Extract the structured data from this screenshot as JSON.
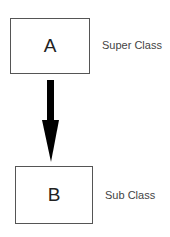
{
  "diagram": {
    "nodes": [
      {
        "id": "A",
        "label": "A",
        "annotation": "Super Class"
      },
      {
        "id": "B",
        "label": "B",
        "annotation": "Sub Class"
      }
    ],
    "edges": [
      {
        "from": "A",
        "to": "B",
        "style": "thick-arrow",
        "color": "#000000"
      }
    ]
  }
}
